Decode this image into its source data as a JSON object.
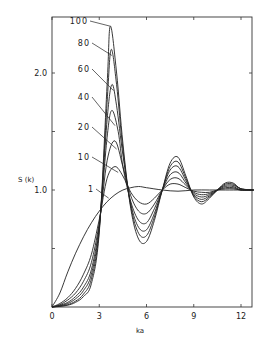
{
  "chart_data": {
    "type": "line",
    "title": "",
    "xlabel": "ka",
    "ylabel": "S (k)",
    "xlim": [
      0,
      12.8
    ],
    "ylim": [
      0,
      2.55
    ],
    "x_ticks": [
      0,
      3,
      6,
      9,
      12
    ],
    "x_tick_labels": [
      "0",
      "3",
      "6",
      "9",
      "12"
    ],
    "y_ticks": [
      0.5,
      1.0,
      1.5,
      2.0
    ],
    "y_tick_labels": [
      "",
      "1.0",
      "",
      "2.0"
    ],
    "grid": false,
    "legend": "inline labels near first peak",
    "series": [
      {
        "name": "1",
        "x": [
          0,
          0.5,
          1,
          1.5,
          2,
          2.5,
          3,
          3.5,
          4,
          4.5,
          5,
          5.5,
          6,
          7,
          8,
          9,
          10,
          11,
          12,
          12.8
        ],
        "y": [
          0,
          0.12,
          0.3,
          0.46,
          0.6,
          0.72,
          0.82,
          0.9,
          0.96,
          1.0,
          1.02,
          1.03,
          1.02,
          1.0,
          0.99,
          1.0,
          1.0,
          1.0,
          1.0,
          1.0
        ]
      },
      {
        "name": "10",
        "x": [
          0,
          0.5,
          1,
          1.5,
          2,
          2.5,
          3,
          3.5,
          4,
          4.5,
          5,
          5.5,
          6,
          6.5,
          7,
          7.5,
          8,
          8.5,
          9,
          9.5,
          10,
          10.5,
          11,
          11.5,
          12,
          12.8
        ],
        "y": [
          0,
          0.03,
          0.08,
          0.16,
          0.28,
          0.45,
          0.75,
          1.1,
          1.2,
          1.12,
          0.98,
          0.9,
          0.88,
          0.93,
          1.0,
          1.05,
          1.05,
          1.02,
          0.99,
          0.98,
          0.98,
          1.0,
          1.01,
          1.01,
          1.0,
          1.0
        ]
      },
      {
        "name": "20",
        "x": [
          0,
          0.5,
          1,
          1.5,
          2,
          2.5,
          3,
          3.5,
          4,
          4.5,
          5,
          5.5,
          6,
          6.5,
          7,
          7.5,
          8,
          8.5,
          9,
          9.5,
          10,
          10.5,
          11,
          11.5,
          12,
          12.8
        ],
        "y": [
          0,
          0.02,
          0.06,
          0.12,
          0.22,
          0.38,
          0.72,
          1.25,
          1.42,
          1.2,
          0.95,
          0.82,
          0.8,
          0.88,
          1.0,
          1.09,
          1.1,
          1.04,
          0.98,
          0.96,
          0.97,
          1.0,
          1.02,
          1.02,
          1.0,
          1.0
        ]
      },
      {
        "name": "40",
        "x": [
          0,
          0.5,
          1,
          1.5,
          2,
          2.5,
          3,
          3.5,
          3.8,
          4.2,
          4.5,
          5,
          5.5,
          6,
          6.5,
          7,
          7.5,
          8,
          8.5,
          9,
          9.5,
          10,
          10.5,
          11,
          11.5,
          12,
          12.8
        ],
        "y": [
          0,
          0.015,
          0.04,
          0.09,
          0.17,
          0.32,
          0.7,
          1.45,
          1.68,
          1.5,
          1.2,
          0.9,
          0.74,
          0.72,
          0.84,
          1.0,
          1.13,
          1.15,
          1.06,
          0.97,
          0.94,
          0.96,
          1.0,
          1.03,
          1.03,
          1.0,
          1.0
        ]
      },
      {
        "name": "60",
        "x": [
          0,
          0.5,
          1,
          1.5,
          2,
          2.5,
          3,
          3.5,
          3.8,
          4.1,
          4.5,
          5,
          5.5,
          6,
          6.5,
          7,
          7.5,
          8,
          8.5,
          9,
          9.5,
          10,
          10.5,
          11,
          11.5,
          12,
          12.8
        ],
        "y": [
          0,
          0.01,
          0.03,
          0.07,
          0.14,
          0.28,
          0.68,
          1.6,
          1.9,
          1.72,
          1.3,
          0.88,
          0.68,
          0.66,
          0.8,
          1.0,
          1.17,
          1.2,
          1.08,
          0.96,
          0.92,
          0.95,
          1.0,
          1.04,
          1.04,
          1.01,
          1.0
        ]
      },
      {
        "name": "80",
        "x": [
          0,
          0.5,
          1,
          1.5,
          2,
          2.5,
          3,
          3.5,
          3.75,
          4.1,
          4.5,
          5,
          5.5,
          6,
          6.5,
          7,
          7.5,
          8,
          8.5,
          9,
          9.5,
          10,
          10.5,
          11,
          11.5,
          12,
          12.8
        ],
        "y": [
          0,
          0.008,
          0.02,
          0.05,
          0.11,
          0.24,
          0.66,
          1.75,
          2.2,
          1.9,
          1.35,
          0.86,
          0.63,
          0.61,
          0.77,
          1.0,
          1.2,
          1.24,
          1.1,
          0.95,
          0.9,
          0.94,
          1.0,
          1.05,
          1.05,
          1.01,
          1.0
        ]
      },
      {
        "name": "100",
        "x": [
          0,
          0.5,
          1,
          1.5,
          2,
          2.5,
          3,
          3.5,
          3.7,
          4.1,
          4.5,
          5,
          5.5,
          6,
          6.5,
          7,
          7.5,
          8,
          8.5,
          9,
          9.5,
          10,
          10.5,
          11,
          11.5,
          12,
          12.8
        ],
        "y": [
          0,
          0.005,
          0.015,
          0.04,
          0.09,
          0.2,
          0.64,
          1.9,
          2.4,
          2.0,
          1.4,
          0.84,
          0.58,
          0.56,
          0.74,
          1.0,
          1.23,
          1.28,
          1.12,
          0.94,
          0.88,
          0.93,
          1.0,
          1.06,
          1.06,
          1.01,
          1.0
        ]
      }
    ],
    "annotations": [
      {
        "text": "100",
        "series": "100",
        "x": 3.7,
        "y": 2.4
      },
      {
        "text": "80",
        "series": "80",
        "x": 3.8,
        "y": 2.15
      },
      {
        "text": "60",
        "series": "60",
        "x": 3.9,
        "y": 1.85
      },
      {
        "text": "40",
        "series": "40",
        "x": 4.0,
        "y": 1.55
      },
      {
        "text": "20",
        "series": "20",
        "x": 4.1,
        "y": 1.35
      },
      {
        "text": "10",
        "series": "10",
        "x": 4.2,
        "y": 1.15
      },
      {
        "text": "1",
        "series": "1",
        "x": 3.6,
        "y": 0.93
      }
    ]
  }
}
